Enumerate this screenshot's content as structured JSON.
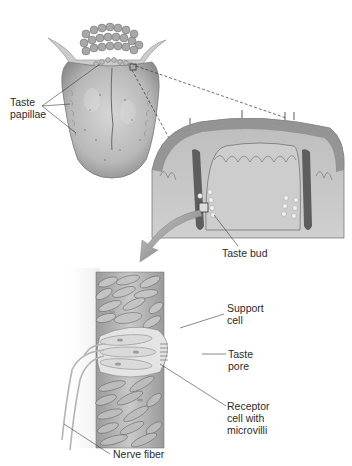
{
  "figure": {
    "panels": [
      {
        "id": "tongue",
        "description": "Dorsal view of tongue"
      },
      {
        "id": "papilla-section",
        "description": "Cross-section of papilla"
      },
      {
        "id": "taste-bud-detail",
        "description": "Enlarged taste bud"
      }
    ]
  },
  "labels": {
    "taste_papillae": "Taste\npapillae",
    "taste_bud": "Taste bud",
    "support_cell": "Support\ncell",
    "taste_pore": "Taste\npore",
    "receptor_cell": "Receptor\ncell with\nmicrovilli",
    "nerve_fiber": "Nerve fiber"
  },
  "colors": {
    "tissue_light": "#d8d8d8",
    "tissue_mid": "#b5b5b5",
    "tissue_dark": "#7a7a7a",
    "outline": "#555555",
    "leader_line": "#3a3a3a",
    "text": "#2b2b2b",
    "background": "#ffffff"
  }
}
